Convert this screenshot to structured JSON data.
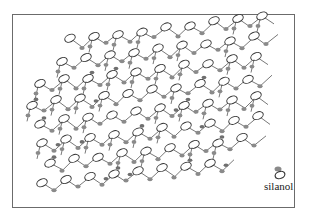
{
  "diagram": {
    "type": "silica surface network",
    "elements": {
      "silicon_atom": "open-ellipse",
      "oxygen_atom": "gray-blob"
    },
    "colors": {
      "border": "#6b6b6b",
      "bond": "#555555",
      "ellipse_stroke": "#333333",
      "oxygen": "#8a8a8a"
    }
  },
  "legend": {
    "items": [
      {
        "icon": "silanol-icon",
        "label": "silanol"
      }
    ]
  }
}
